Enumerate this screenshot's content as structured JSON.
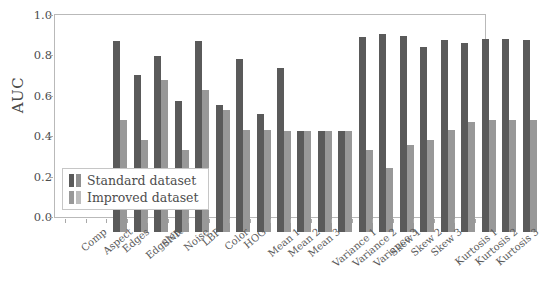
{
  "chart_data": {
    "type": "bar",
    "title": "",
    "xlabel": "",
    "ylabel": "AUC",
    "ylim": [
      0.0,
      1.0
    ],
    "yticks": [
      "0.0",
      "0.2",
      "0.4",
      "0.6",
      "0.8",
      "1.0"
    ],
    "grid": false,
    "legend_position": "lower-left-inside",
    "categories": [
      "Comp",
      "Aspect",
      "Edges",
      "Edgelen",
      "SNR",
      "Noise",
      "LBP",
      "Color",
      "HOG",
      "Mean 1",
      "Mean 2",
      "Mean 3",
      "Variance 1",
      "Variance 2",
      "Variance 3",
      "Skew 1",
      "Skew 2",
      "Skew 3",
      "Kurtosis 1",
      "Kurtosis 2",
      "Kurtosis 3"
    ],
    "series": [
      {
        "name": "Standard dataset",
        "color": "#5a5a5a",
        "values": [
          0.945,
          0.775,
          0.87,
          0.65,
          0.945,
          0.63,
          0.855,
          0.585,
          0.81,
          0.5,
          0.5,
          0.5,
          0.965,
          0.98,
          0.97,
          0.915,
          0.95,
          0.935,
          0.955,
          0.955,
          0.95
        ]
      },
      {
        "name": "Improved dataset",
        "color": "#989898",
        "values": [
          0.555,
          0.455,
          0.755,
          0.405,
          0.705,
          0.605,
          0.505,
          0.505,
          0.5,
          0.5,
          0.5,
          0.5,
          0.405,
          0.315,
          0.43,
          0.455,
          0.505,
          0.545,
          0.555,
          0.555,
          0.555
        ]
      }
    ]
  },
  "legend": {
    "items": [
      {
        "label": "Standard dataset"
      },
      {
        "label": "Improved dataset"
      }
    ]
  }
}
